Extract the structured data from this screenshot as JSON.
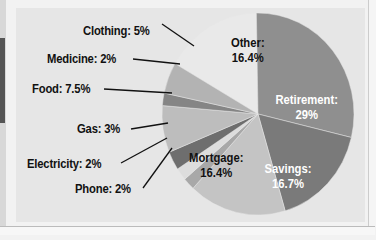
{
  "chart_data": {
    "type": "pie",
    "title": "",
    "categories": [
      "Other",
      "Retirement",
      "Savings",
      "Mortgage",
      "Phone",
      "Electricity",
      "Gas",
      "Food",
      "Medicine",
      "Clothing"
    ],
    "values": [
      16.4,
      29,
      16.7,
      16.4,
      2,
      2,
      3,
      7.5,
      2,
      5
    ],
    "labels": {
      "other": "Other:",
      "other_val": "16.4%",
      "retirement": "Retirement:",
      "retirement_val": "29%",
      "savings": "Savings:",
      "savings_val": "16.7%",
      "mortgage": "Mortgage:",
      "mortgage_val": "16.4%",
      "phone": "Phone: 2%",
      "electricity": "Electricity: 2%",
      "gas": "Gas: 3%",
      "food": "Food: 7.5%",
      "medicine": "Medicine: 2%",
      "clothing": "Clothing: 5%"
    },
    "colors": {
      "other": "#e9e9e9",
      "retirement": "#8f8f8f",
      "savings": "#7a7a7a",
      "mortgage": "#c4c4c4",
      "phone": "#a8a8a8",
      "electricity": "#dddddd",
      "gas": "#6e6e6e",
      "food": "#bdbdbd",
      "medicine": "#858585",
      "clothing": "#b3b3b3"
    },
    "legend": "none"
  }
}
